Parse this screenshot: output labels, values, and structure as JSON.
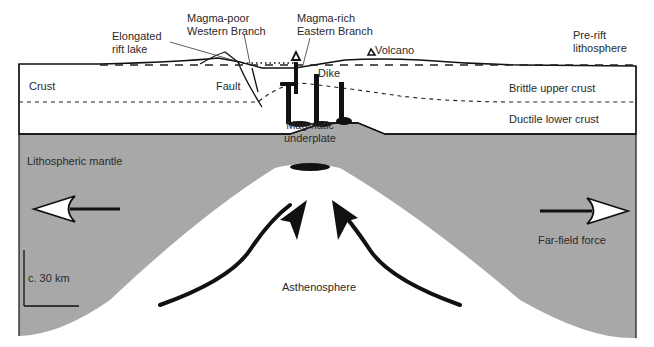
{
  "diagram": {
    "title": "",
    "colors": {
      "lithospheric_mantle": "#a8a8a8",
      "crust": "#ffffff",
      "asthenosphere": "#ffffff",
      "outline": "#111111"
    },
    "labels": {
      "elongated_rift_lake": [
        "Elongated",
        "rift lake"
      ],
      "magma_poor": [
        "Magma-poor",
        "Western Branch"
      ],
      "magma_rich": [
        "Magma-rich",
        "Eastern Branch"
      ],
      "volcano": "Volcano",
      "pre_rift": [
        "Pre-rift",
        "lithosphere"
      ],
      "crust": "Crust",
      "fault": "Fault",
      "dike": "Dike",
      "brittle_upper_crust": "Brittle upper crust",
      "ductile_lower_crust": "Ductile lower crust",
      "magmatic_underplate": [
        "Magmatic",
        "underplate"
      ],
      "lithospheric_mantle": "Lithospheric mantle",
      "far_field_force": "Far-field force",
      "scale_bar": "c. 30 km",
      "asthenosphere": "Asthenosphere"
    },
    "icons": {
      "left_arrow": "far-field-force-arrow-left",
      "right_arrow": "far-field-force-arrow-right",
      "upwelling_arrows": "asthenosphere-upwelling-arrows",
      "volcano": "volcano-triangle"
    }
  }
}
